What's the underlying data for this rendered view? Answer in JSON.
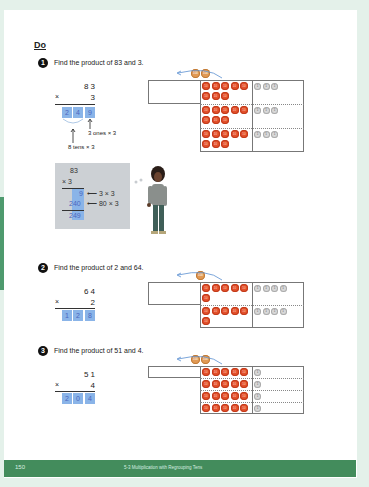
{
  "section": {
    "heading": "Do"
  },
  "questions": [
    {
      "number": "1",
      "prompt": "Find the product of 83 and 3.",
      "multiplicand": "8 3",
      "multiplier": "3",
      "times": "×",
      "answer_digits": [
        "2",
        "4",
        "9"
      ],
      "notes": {
        "ones": "3 ones × 3",
        "tens": "8 tens × 3"
      },
      "chart": {
        "rows": 3,
        "tens_per_row": 8,
        "ones_per_row": 3,
        "regrouped_hundreds": 2
      }
    },
    {
      "number": "2",
      "prompt": "Find the product of 2 and 64.",
      "multiplicand": "6 4",
      "multiplier": "2",
      "times": "×",
      "answer_digits": [
        "1",
        "2",
        "8"
      ],
      "chart": {
        "rows": 2,
        "tens_per_row": 6,
        "ones_per_row": 4,
        "regrouped_hundreds": 1
      }
    },
    {
      "number": "3",
      "prompt": "Find the product of 51 and 4.",
      "multiplicand": "5 1",
      "multiplier": "4",
      "times": "×",
      "answer_digits": [
        "2",
        "0",
        "4"
      ],
      "chart": {
        "rows": 4,
        "tens_per_row": 5,
        "ones_per_row": 1,
        "regrouped_hundreds": 2
      }
    }
  ],
  "worked_example": {
    "top": "83",
    "mult": "× 3",
    "partial1": "9",
    "partial1_note": "⟵ 3 × 3",
    "partial2": "240",
    "partial2_note": "⟵ 80 × 3",
    "total": "249"
  },
  "counter_labels": {
    "hundred": "100",
    "ten": "10",
    "one": "1"
  },
  "footer": {
    "page_number": "150",
    "lesson_title": "5-3 Multiplication with Regrouping Tens"
  },
  "colors": {
    "background": "#e4f1ea",
    "footer": "#438c5c",
    "tens_counter": "#e3502b",
    "hundreds_counter": "#e19a55",
    "ones_counter": "#d8d8d8",
    "answer_box": "#8ab4e8"
  }
}
